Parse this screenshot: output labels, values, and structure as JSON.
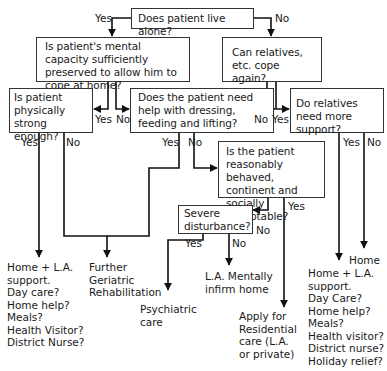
{
  "nodes": {
    "live_alone": "Does patient live alone?",
    "mental_capacity": "Is patient's mental capacity sufficiently preserved to allow him to cope at home?",
    "relatives_cope": "Can relatives, etc. cope again?",
    "physically_strong": "Is patient physically strong enough?",
    "need_help": "Does the patient need help with dressing, feeding and lifting?",
    "relatives_support": "Do relatives need more support?",
    "reasonably_behaved": "Is the patient reasonably behaved, continent and socially acceptable?",
    "severe_disturbance": "Severe disturbance?"
  },
  "edge_labels": {
    "live_alone_yes": "Yes",
    "live_alone_no": "No",
    "mental_yes": "Yes",
    "mental_no": "No",
    "relatives_no": "No",
    "relatives_yes": "Yes",
    "strong_yes": "Yes",
    "strong_no": "No",
    "help_yes": "Yes",
    "help_no": "No",
    "support_yes": "Yes",
    "support_no": "No",
    "behaved_yes": "Yes",
    "behaved_no": "No",
    "severe_yes": "Yes",
    "severe_no": "No"
  },
  "outcomes": {
    "home_la_support_1": "Home + L.A.\nsupport.\nDay care?\nHome help?\nMeals?\nHealth Visitor?\nDistrict Nurse?",
    "further_rehab": "Further\nGeriatric\nRehabilitation",
    "psychiatric_care": "Psychiatric\ncare",
    "la_mentally_infirm": "L.A. Mentally\ninfirm home",
    "residential_care": "Apply for\nResidential\ncare (L.A.\nor private)",
    "home": "Home",
    "home_la_support_2": "Home + L.A.\nsupport.\nDay Care?\nHome help?\nMeals?\nHealth visitor?\nDistrict nurse?\nHoliday relief?"
  }
}
